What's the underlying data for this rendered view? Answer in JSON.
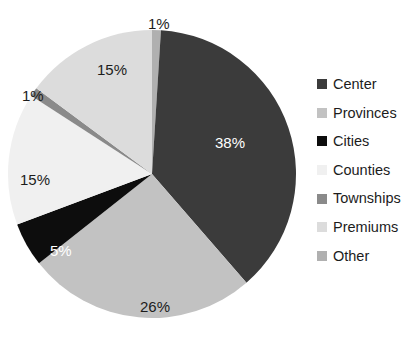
{
  "chart_data": {
    "type": "pie",
    "title": "",
    "labels": [
      "Center",
      "Provinces",
      "Cities",
      "Counties",
      "Townships",
      "Premiums",
      "Other"
    ],
    "values": [
      38,
      26,
      5,
      15,
      1,
      15,
      1
    ],
    "value_labels": [
      "38%",
      "26%",
      "5%",
      "15%",
      "1%",
      "15%",
      "1%"
    ],
    "colors": [
      "#3b3b3b",
      "#c2c2c2",
      "#0d0d0d",
      "#f0f0f0",
      "#8a8a8a",
      "#dcdcdc",
      "#b0b0b0"
    ],
    "label_text_colors": [
      "#ffffff",
      "#1c1c1c",
      "#ffffff",
      "#1c1c1c",
      "#1c1c1c",
      "#1c1c1c",
      "#1c1c1c"
    ],
    "legend_position": "right",
    "start_angle_deg": -90,
    "direction": "clockwise",
    "units": "percent",
    "grid": false,
    "xlabel": "",
    "ylabel": ""
  },
  "slice_labels": [
    {
      "text": "1%",
      "left": 148,
      "top": 16,
      "tone": "dark",
      "name": "slice-label-other"
    },
    {
      "text": "38%",
      "left": 215,
      "top": 135,
      "tone": "light",
      "name": "slice-label-center"
    },
    {
      "text": "26%",
      "left": 140,
      "top": 299,
      "tone": "dark",
      "name": "slice-label-provinces"
    },
    {
      "text": "5%",
      "left": 50,
      "top": 243,
      "tone": "light",
      "name": "slice-label-cities"
    },
    {
      "text": "15%",
      "left": 20,
      "top": 172,
      "tone": "dark",
      "name": "slice-label-counties"
    },
    {
      "text": "1%",
      "left": 22,
      "top": 88,
      "tone": "dark",
      "name": "slice-label-townships"
    },
    {
      "text": "15%",
      "left": 97,
      "top": 62,
      "tone": "dark",
      "name": "slice-label-premiums"
    }
  ],
  "legend": {
    "items": [
      {
        "label": "Center",
        "color": "#3b3b3b"
      },
      {
        "label": "Provinces",
        "color": "#c2c2c2"
      },
      {
        "label": "Cities",
        "color": "#0d0d0d"
      },
      {
        "label": "Counties",
        "color": "#f0f0f0"
      },
      {
        "label": "Townships",
        "color": "#8a8a8a"
      },
      {
        "label": "Premiums",
        "color": "#dcdcdc"
      },
      {
        "label": "Other",
        "color": "#b0b0b0"
      }
    ]
  },
  "geometry": {
    "center_x": 152,
    "center_y": 174,
    "radius": 144
  }
}
